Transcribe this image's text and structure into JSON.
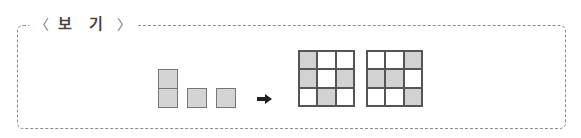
{
  "box": {
    "label_left": "〈",
    "label_text": "보 기",
    "label_right": "〉"
  },
  "pieces": [
    {
      "name": "domino-vertical",
      "cells": [
        [
          0,
          0
        ],
        [
          1,
          0
        ]
      ]
    },
    {
      "name": "monomino-1",
      "cells": [
        [
          0,
          0
        ]
      ]
    },
    {
      "name": "monomino-2",
      "cells": [
        [
          0,
          0
        ]
      ]
    }
  ],
  "arrow": "right-arrow",
  "grids": [
    {
      "name": "result-grid-1",
      "shaded": [
        [
          1,
          0,
          0
        ],
        [
          1,
          0,
          1
        ],
        [
          0,
          1,
          0
        ]
      ]
    },
    {
      "name": "result-grid-2",
      "shaded": [
        [
          0,
          0,
          1
        ],
        [
          1,
          1,
          0
        ],
        [
          0,
          0,
          1
        ]
      ]
    }
  ],
  "colors": {
    "shade": "#d2d2d2",
    "border": "#555555",
    "frame": "#8a8a8a"
  }
}
